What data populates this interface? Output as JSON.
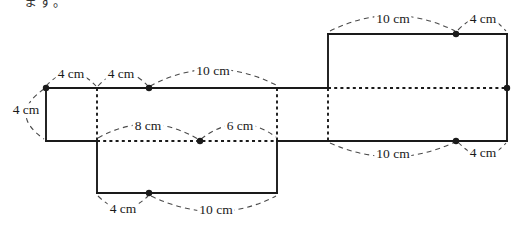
{
  "page": {
    "top_partial_text": "ます。",
    "background_color": "#ffffff"
  },
  "diagram": {
    "type": "box-net",
    "unit": "cm",
    "line_color": "#1a1a1a",
    "arc_color": "#4a4a4a",
    "labels": [
      {
        "id": "top-left-first-4cm",
        "text": "4 cm"
      },
      {
        "id": "top-left-second-4cm",
        "text": "4 cm"
      },
      {
        "id": "top-middle-10cm",
        "text": "10 cm"
      },
      {
        "id": "left-side-4cm",
        "text": "4 cm"
      },
      {
        "id": "middle-8cm",
        "text": "8 cm"
      },
      {
        "id": "middle-6cm",
        "text": "6 cm"
      },
      {
        "id": "top-right-10cm",
        "text": "10 cm"
      },
      {
        "id": "top-right-4cm",
        "text": "4 cm"
      },
      {
        "id": "bottom-right-10cm",
        "text": "10 cm"
      },
      {
        "id": "bottom-right-4cm",
        "text": "4 cm"
      },
      {
        "id": "bottom-middle-4cm",
        "text": "4 cm"
      },
      {
        "id": "bottom-middle-10cm",
        "text": "10 cm"
      }
    ],
    "measurements": {
      "left_square": {
        "width_cm": 4,
        "height_cm": 4
      },
      "top_edge_segments_cm": [
        4,
        4,
        10
      ],
      "middle_fold_segments_cm": [
        8,
        6
      ],
      "top_right_edge_segments_cm": [
        10,
        4
      ],
      "bottom_right_edge_segments_cm": [
        10,
        4
      ],
      "bottom_edge_segments_cm": [
        4,
        10
      ]
    }
  }
}
